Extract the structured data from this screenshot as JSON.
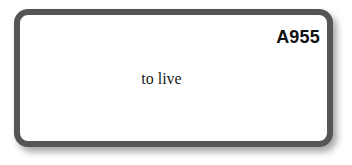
{
  "card": {
    "code": "A955",
    "text": "to live",
    "border_color": "#555555"
  }
}
